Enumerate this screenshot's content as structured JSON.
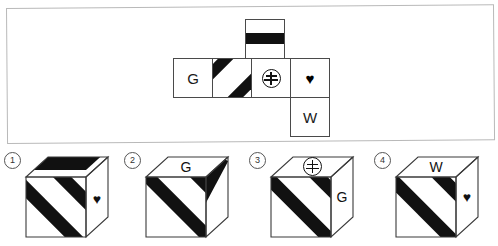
{
  "figure": {
    "kind": "cube-net-folding-puzzle",
    "panel": {
      "border_color": "#b9b9b9",
      "background": "#ffffff"
    },
    "ink_color": "#111111",
    "line_color": "#4a4a4a"
  },
  "net": {
    "description": "Unfolded cube net with six faces",
    "faces": [
      {
        "id": "top-band",
        "label": "",
        "pattern": "horizontal-black-band",
        "row": 0,
        "col": 2
      },
      {
        "id": "g-face",
        "label": "G",
        "pattern": "plain",
        "row": 1,
        "col": 0
      },
      {
        "id": "stripe-face",
        "label": "",
        "pattern": "two-diagonal-stripes",
        "row": 1,
        "col": 1
      },
      {
        "id": "symbol-face",
        "label": "",
        "pattern": "circled-symbol",
        "row": 1,
        "col": 2
      },
      {
        "id": "heart-face",
        "label": "♥",
        "pattern": "heart",
        "row": 1,
        "col": 3
      },
      {
        "id": "w-face",
        "label": "W",
        "pattern": "plain",
        "row": 2,
        "col": 3
      }
    ],
    "symbol_name": "circled-yen-symbol"
  },
  "options": [
    {
      "number": "1",
      "top_face": {
        "pattern": "horizontal-black-band",
        "label": ""
      },
      "front_face": {
        "pattern": "two-diagonal-stripes",
        "label": ""
      },
      "right_face": {
        "pattern": "heart",
        "label": "♥"
      }
    },
    {
      "number": "2",
      "top_face": {
        "pattern": "plain",
        "label": "G"
      },
      "front_face": {
        "pattern": "two-diagonal-stripes",
        "label": ""
      },
      "right_face": {
        "pattern": "two-diagonal-stripes",
        "label": ""
      }
    },
    {
      "number": "3",
      "top_face": {
        "pattern": "circled-symbol",
        "label": ""
      },
      "front_face": {
        "pattern": "two-diagonal-stripes",
        "label": ""
      },
      "right_face": {
        "pattern": "plain",
        "label": "G"
      }
    },
    {
      "number": "4",
      "top_face": {
        "pattern": "plain",
        "label": "W"
      },
      "front_face": {
        "pattern": "two-diagonal-stripes",
        "label": ""
      },
      "right_face": {
        "pattern": "heart",
        "label": "♥"
      }
    }
  ]
}
